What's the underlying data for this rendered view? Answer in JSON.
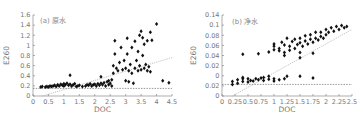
{
  "chart_data": [
    {
      "type": "scatter",
      "title": "(a) 原水",
      "xlabel": "DOC",
      "ylabel": "E260",
      "xlim": [
        0,
        4.5
      ],
      "ylim": [
        0,
        1.6
      ],
      "x_ticks": [
        "0",
        "0.5",
        "1",
        "1.5",
        "2",
        "2.5",
        "3",
        "3.5",
        "4",
        "4.5"
      ],
      "y_ticks": [
        "0",
        "0.2",
        "0.4",
        "0.6",
        "0.8",
        "1",
        "1.2",
        "1.4",
        "1.6"
      ],
      "grid": false,
      "legend": null,
      "threshold_line": {
        "y": 0.15,
        "style": "dashed"
      },
      "fit_line": {
        "x": [
          0.3,
          4.5
        ],
        "y": [
          0.0,
          0.76
        ],
        "style": "dotted"
      },
      "points": [
        [
          0.25,
          0.18
        ],
        [
          0.3,
          0.19
        ],
        [
          0.4,
          0.18
        ],
        [
          0.45,
          0.19
        ],
        [
          0.5,
          0.18
        ],
        [
          0.55,
          0.2
        ],
        [
          0.6,
          0.19
        ],
        [
          0.65,
          0.2
        ],
        [
          0.7,
          0.21
        ],
        [
          0.75,
          0.19
        ],
        [
          0.8,
          0.22
        ],
        [
          0.85,
          0.2
        ],
        [
          0.9,
          0.23
        ],
        [
          0.95,
          0.21
        ],
        [
          1.0,
          0.24
        ],
        [
          1.0,
          0.2
        ],
        [
          1.05,
          0.22
        ],
        [
          1.1,
          0.25
        ],
        [
          1.15,
          0.21
        ],
        [
          1.2,
          0.23
        ],
        [
          1.2,
          0.41
        ],
        [
          1.25,
          0.2
        ],
        [
          1.3,
          0.22
        ],
        [
          1.35,
          0.24
        ],
        [
          1.4,
          0.19
        ],
        [
          1.45,
          0.2
        ],
        [
          1.5,
          0.21
        ],
        [
          1.6,
          0.19
        ],
        [
          1.7,
          0.2
        ],
        [
          1.75,
          0.22
        ],
        [
          1.8,
          0.21
        ],
        [
          1.85,
          0.24
        ],
        [
          1.9,
          0.2
        ],
        [
          1.95,
          0.22
        ],
        [
          2.0,
          0.23
        ],
        [
          2.05,
          0.2
        ],
        [
          2.1,
          0.24
        ],
        [
          2.15,
          0.21
        ],
        [
          2.2,
          0.38
        ],
        [
          2.2,
          0.25
        ],
        [
          2.25,
          0.22
        ],
        [
          2.3,
          0.26
        ],
        [
          2.35,
          0.2
        ],
        [
          2.4,
          0.28
        ],
        [
          2.45,
          0.3
        ],
        [
          2.45,
          0.22
        ],
        [
          2.5,
          0.25
        ],
        [
          2.55,
          0.32
        ],
        [
          2.55,
          0.2
        ],
        [
          2.6,
          0.45
        ],
        [
          2.6,
          0.6
        ],
        [
          2.65,
          0.83
        ],
        [
          2.65,
          1.09
        ],
        [
          2.7,
          0.55
        ],
        [
          2.75,
          0.5
        ],
        [
          2.8,
          0.66
        ],
        [
          2.85,
          0.96
        ],
        [
          2.9,
          0.52
        ],
        [
          2.95,
          0.7
        ],
        [
          3.0,
          0.3
        ],
        [
          3.0,
          0.55
        ],
        [
          3.05,
          0.83
        ],
        [
          3.05,
          1.14
        ],
        [
          3.1,
          0.5
        ],
        [
          3.1,
          0.28
        ],
        [
          3.15,
          0.62
        ],
        [
          3.2,
          0.96
        ],
        [
          3.2,
          0.45
        ],
        [
          3.25,
          0.25
        ],
        [
          3.3,
          0.55
        ],
        [
          3.3,
          1.08
        ],
        [
          3.35,
          0.7
        ],
        [
          3.4,
          0.5
        ],
        [
          3.4,
          0.88
        ],
        [
          3.45,
          1.2
        ],
        [
          3.45,
          0.6
        ],
        [
          3.5,
          1.28
        ],
        [
          3.5,
          0.52
        ],
        [
          3.55,
          0.8
        ],
        [
          3.55,
          1.15
        ],
        [
          3.6,
          0.55
        ],
        [
          3.6,
          1.02
        ],
        [
          3.65,
          0.62
        ],
        [
          3.7,
          0.5
        ],
        [
          3.7,
          1.09
        ],
        [
          3.75,
          0.58
        ],
        [
          3.8,
          1.26
        ],
        [
          3.8,
          0.48
        ],
        [
          3.85,
          1.1
        ],
        [
          4.0,
          1.42
        ],
        [
          4.2,
          0.3
        ],
        [
          4.4,
          0.26
        ]
      ]
    },
    {
      "type": "scatter",
      "title": "(b) 净水",
      "xlabel": "DOC",
      "ylabel": "E260",
      "xlim": [
        0,
        2.5
      ],
      "ylim": [
        0,
        0.14
      ],
      "x_ticks": [
        "0",
        "0.25",
        "0.5",
        "0.75",
        "1",
        "1.25",
        "1.5",
        "1.75",
        "2",
        "2.25",
        "2.5"
      ],
      "y_ticks": [
        "0",
        "0.02",
        "0",
        "0.02",
        "0.04",
        "0.06",
        "0.08",
        "0.1",
        "0.14"
      ],
      "grid": false,
      "legend": null,
      "threshold_line": {
        "y": 0.02,
        "style": "dashed"
      },
      "fit_line": {
        "x": [
          0.2,
          2.5
        ],
        "y": [
          0.0,
          0.115
        ],
        "style": "dotted"
      },
      "points": [
        [
          0.2,
          0.02
        ],
        [
          0.2,
          0.025
        ],
        [
          0.3,
          0.022
        ],
        [
          0.3,
          0.028
        ],
        [
          0.4,
          0.025
        ],
        [
          0.4,
          0.03
        ],
        [
          0.4,
          0.032
        ],
        [
          0.5,
          0.024
        ],
        [
          0.5,
          0.03
        ],
        [
          0.55,
          0.027
        ],
        [
          0.6,
          0.026
        ],
        [
          0.65,
          0.03
        ],
        [
          0.7,
          0.028
        ],
        [
          0.75,
          0.031
        ],
        [
          0.8,
          0.032
        ],
        [
          0.8,
          0.027
        ],
        [
          0.9,
          0.029
        ],
        [
          0.9,
          0.034
        ],
        [
          1.0,
          0.03
        ],
        [
          1.0,
          0.026
        ],
        [
          1.1,
          0.028
        ],
        [
          1.2,
          0.03
        ],
        [
          1.25,
          0.034
        ],
        [
          1.5,
          0.034
        ],
        [
          1.75,
          0.031
        ],
        [
          0.4,
          0.072
        ],
        [
          0.7,
          0.073
        ],
        [
          0.9,
          0.076
        ],
        [
          1.0,
          0.08
        ],
        [
          1.0,
          0.086
        ],
        [
          1.0,
          0.09
        ],
        [
          1.1,
          0.078
        ],
        [
          1.1,
          0.082
        ],
        [
          1.15,
          0.093
        ],
        [
          1.2,
          0.07
        ],
        [
          1.2,
          0.075
        ],
        [
          1.2,
          0.088
        ],
        [
          1.25,
          0.1
        ],
        [
          1.3,
          0.079
        ],
        [
          1.3,
          0.086
        ],
        [
          1.35,
          0.094
        ],
        [
          1.4,
          0.082
        ],
        [
          1.4,
          0.098
        ],
        [
          1.45,
          0.089
        ],
        [
          1.5,
          0.066
        ],
        [
          1.5,
          0.075
        ],
        [
          1.5,
          0.092
        ],
        [
          1.5,
          0.1
        ],
        [
          1.55,
          0.086
        ],
        [
          1.6,
          0.095
        ],
        [
          1.6,
          0.104
        ],
        [
          1.65,
          0.09
        ],
        [
          1.7,
          0.098
        ],
        [
          1.7,
          0.106
        ],
        [
          1.75,
          0.074
        ],
        [
          1.75,
          0.093
        ],
        [
          1.8,
          0.1
        ],
        [
          1.8,
          0.11
        ],
        [
          1.85,
          0.097
        ],
        [
          1.9,
          0.103
        ],
        [
          1.9,
          0.11
        ],
        [
          1.95,
          0.1
        ],
        [
          2.0,
          0.106
        ],
        [
          2.0,
          0.115
        ],
        [
          2.05,
          0.11
        ],
        [
          2.1,
          0.118
        ],
        [
          2.15,
          0.112
        ],
        [
          2.2,
          0.12
        ],
        [
          2.25,
          0.115
        ],
        [
          2.3,
          0.122
        ],
        [
          2.35,
          0.118
        ],
        [
          2.4,
          0.12
        ]
      ]
    }
  ]
}
